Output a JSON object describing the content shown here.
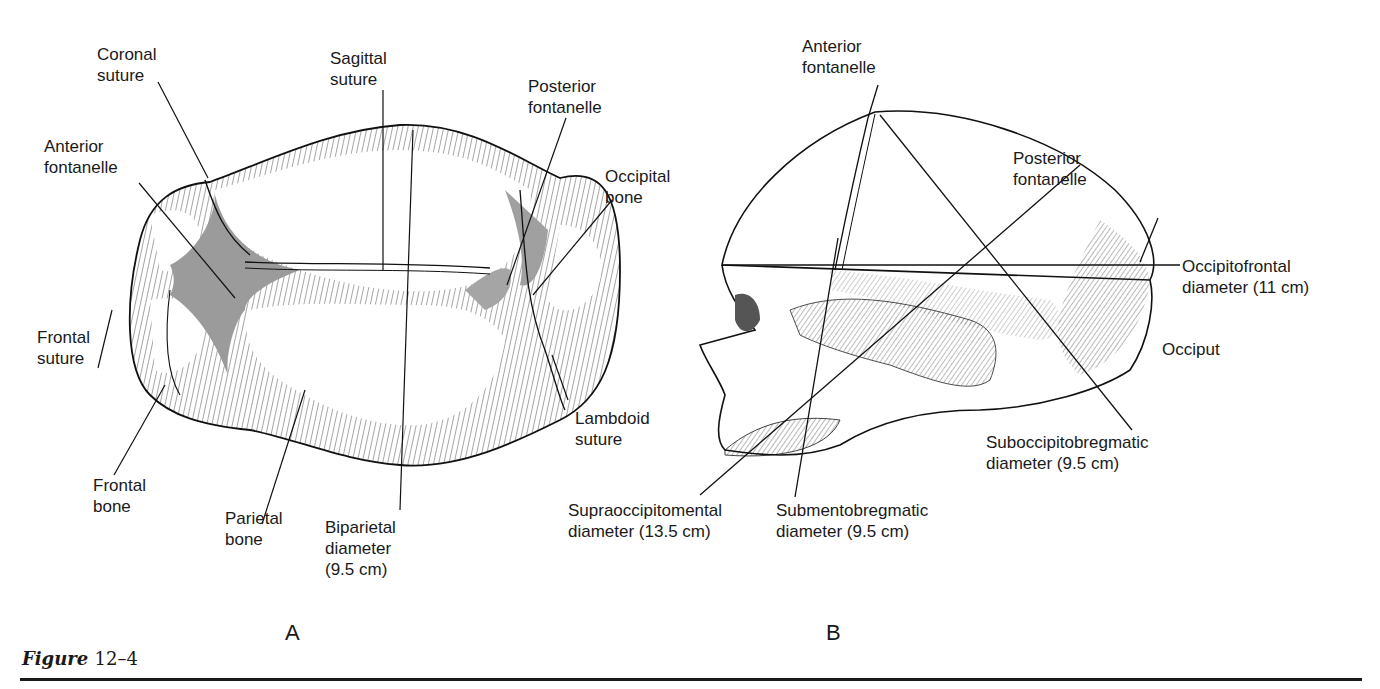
{
  "figure": {
    "caption_prefix": "Figure",
    "caption_number": "12–4"
  },
  "panel_a": {
    "letter": "A",
    "labels": {
      "coronal_suture": [
        "Coronal",
        "suture"
      ],
      "sagittal_suture": [
        "Sagittal",
        "suture"
      ],
      "posterior_fontanelle": [
        "Posterior",
        "fontanelle"
      ],
      "anterior_fontanelle": [
        "Anterior",
        "fontanelle"
      ],
      "occipital_bone": [
        "Occipital",
        "bone"
      ],
      "frontal_suture": [
        "Frontal",
        "suture"
      ],
      "lambdoid_suture": [
        "Lambdoid",
        "suture"
      ],
      "frontal_bone": [
        "Frontal",
        "bone"
      ],
      "parietal_bone": [
        "Parietal",
        "bone"
      ],
      "biparietal_diameter": [
        "Biparietal",
        "diameter",
        "(9.5 cm)"
      ]
    }
  },
  "panel_b": {
    "letter": "B",
    "labels": {
      "anterior_fontanelle": [
        "Anterior",
        "fontanelle"
      ],
      "posterior_fontanelle": [
        "Posterior",
        "fontanelle"
      ],
      "occipitofrontal_diameter": [
        "Occipitofrontal",
        "diameter (11 cm)"
      ],
      "occiput": [
        "Occiput"
      ],
      "suboccipitobregmatic_diameter": [
        "Suboccipitobregmatic",
        "diameter (9.5 cm)"
      ],
      "supraoccipitomental_diameter": [
        "Supraoccipitomental",
        "diameter (13.5 cm)"
      ],
      "submentobregmatic_diameter": [
        "Submentobregmatic",
        "diameter (9.5 cm)"
      ]
    }
  }
}
